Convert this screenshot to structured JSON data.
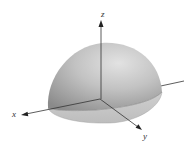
{
  "figure": {
    "type": "3d-surface-diagram",
    "surface": "hemisphere",
    "colors": {
      "surface_light": "#d8d8d8",
      "surface_mid": "#b4b4b4",
      "surface_dark": "#8e8e8e",
      "base_fill": "#c6c6c6",
      "axis": "#333333",
      "background": "#ffffff"
    }
  },
  "axes": {
    "x": {
      "label": "x"
    },
    "y": {
      "label": "y"
    },
    "z": {
      "label": "z"
    }
  }
}
